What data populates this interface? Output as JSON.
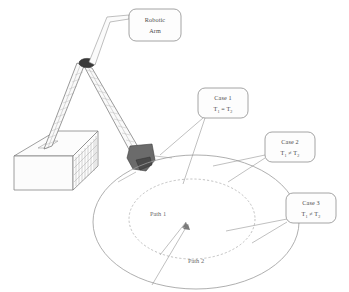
{
  "figure": {
    "background_color": "#ffffff",
    "ink_color": "#8b8b8b"
  },
  "callouts": [
    {
      "id": "robotic-arm",
      "line1": "Robotic",
      "line2": "Arm",
      "x": 155,
      "y": 25
    },
    {
      "id": "case-1",
      "line1": "Case 1",
      "line2_lhs": "T",
      "line2_lhs_sub": "1",
      "line2_op": "=",
      "line2_rhs": "T",
      "line2_rhs_sub": "2",
      "x": 223,
      "y": 104
    },
    {
      "id": "case-2",
      "line1": "Case 2",
      "line2_lhs": "T",
      "line2_lhs_sub": "1",
      "line2_op": "≠",
      "line2_rhs": "T",
      "line2_rhs_sub": "2",
      "x": 290,
      "y": 148
    },
    {
      "id": "case-3",
      "line1": "Case 3",
      "line2_lhs": "T",
      "line2_lhs_sub": "1",
      "line2_op": "≠",
      "line2_rhs": "T",
      "line2_rhs_sub": "2",
      "x": 311,
      "y": 209
    }
  ],
  "paths": [
    {
      "id": "path-1",
      "label": "Path 1",
      "x": 158,
      "y": 214
    },
    {
      "id": "path-2",
      "label": "Path 2",
      "x": 196,
      "y": 261
    }
  ],
  "components": {
    "base_label": "hatched base block",
    "link_lower_label": "lower arm link",
    "link_upper_label": "upper arm link",
    "joint_label": "elbow joint",
    "effector_label": "end effector gripper"
  },
  "workspace": {
    "outer_ellipse": {
      "cx": 196,
      "cy": 222,
      "rx": 103,
      "ry": 67
    },
    "inner_ellipse": {
      "cx": 192,
      "cy": 219,
      "rx": 63,
      "ry": 40
    }
  }
}
